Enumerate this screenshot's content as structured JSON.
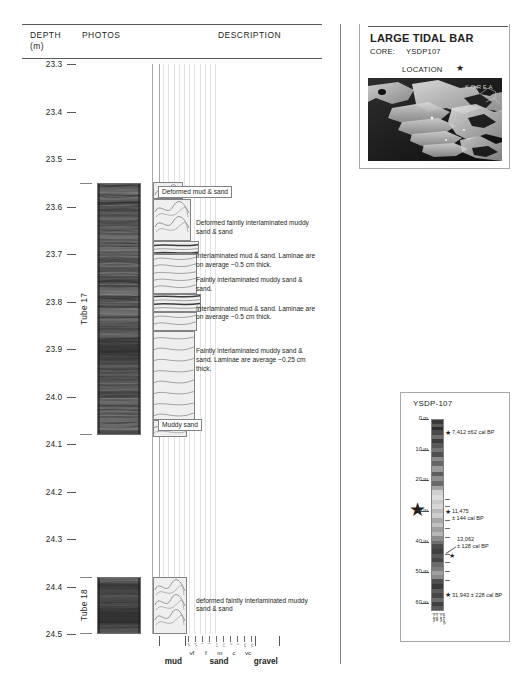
{
  "columns": {
    "depth_label": "DEPTH",
    "depth_unit": "(m)",
    "photos_label": "PHOTOS",
    "description_label": "DESCRIPTION"
  },
  "depth_axis": {
    "unit": "m",
    "min": 23.3,
    "max": 24.5,
    "ticks": [
      "23.3",
      "23.4",
      "23.5",
      "23.6",
      "23.7",
      "23.8",
      "23.9",
      "24.0",
      "24.1",
      "24.2",
      "24.3",
      "24.4",
      "24.5"
    ]
  },
  "tubes": [
    {
      "label": "Tube 17",
      "top_depth": 23.55,
      "bottom_depth": 24.08
    },
    {
      "label": "Tube 18",
      "top_depth": 24.38,
      "bottom_depth": 24.5
    }
  ],
  "descriptions": [
    {
      "text": "Deformed mud & sand",
      "depth": 23.565,
      "boxed": true
    },
    {
      "text": "Deformed faintly interlaminated muddy sand & sand",
      "depth": 23.635,
      "boxed": false
    },
    {
      "text": "Interlaminated mud & sand. Laminae are on average ~0.5 cm thick.",
      "depth": 23.705,
      "boxed": false
    },
    {
      "text": "Faintly interlaminated muddy sand & sand.",
      "depth": 23.755,
      "boxed": false
    },
    {
      "text": "Interlaminated mud & sand. Laminae are on average ~0.5 cm thick.",
      "depth": 23.815,
      "boxed": false
    },
    {
      "text": "Faintly interlaminated muddy sand & sand. Laminae are average ~0.25 cm thick.",
      "depth": 23.905,
      "boxed": false
    },
    {
      "text": "Muddy sand",
      "depth": 24.055,
      "boxed": true
    },
    {
      "text": "deformed faintly interlaminated muddy sand & sand",
      "depth": 24.43,
      "boxed": false
    }
  ],
  "grain_size_axis": {
    "classes": [
      {
        "label": "mud",
        "center_pct": 12
      },
      {
        "label": "sand",
        "center_pct": 50
      },
      {
        "label": "gravel",
        "center_pct": 89
      }
    ],
    "sand_subdivisions": [
      "vf",
      "f",
      "m",
      "c",
      "vc"
    ],
    "sand_sub_repeats": [
      "vf",
      "vf",
      "f",
      "f",
      "m",
      "m",
      "c",
      "c",
      "vc",
      "vc"
    ]
  },
  "title_block": {
    "title": "LARGE TIDAL BAR",
    "core_label": "CORE:",
    "core_id": "YSDP107"
  },
  "location_map": {
    "label": "LOCATION",
    "star": "★",
    "region_label": "KOREA"
  },
  "ysdp_core": {
    "title": "YSDP-107",
    "depth_unit": "m",
    "depth_ticks": [
      "0 m",
      "10 m",
      "20 m",
      "30 m",
      "40 m",
      "50 m",
      "60 m"
    ],
    "dates": [
      {
        "value": "7,412 ±62 cal BP",
        "depth_m": 4.5
      },
      {
        "value": "11,475",
        "value2": "± 144 cal BP",
        "depth_m": 30.5
      },
      {
        "value": "13,062",
        "value2": "± 128 cal BP",
        "depth_m": 42.0
      },
      {
        "value": "31,943 ± 228 cal BP",
        "depth_m": 57.5
      }
    ],
    "star_marker": "★",
    "tidal_bar_star_depth_m": 23.9,
    "footer_labels": [
      "sand",
      "mud",
      "sand",
      "gravel"
    ]
  },
  "colors": {
    "ink": "#231f20",
    "rule": "#58595b",
    "light_rule": "#a7a9ac",
    "grid": "#e2e3e5",
    "litho_fill": "#efefef"
  }
}
